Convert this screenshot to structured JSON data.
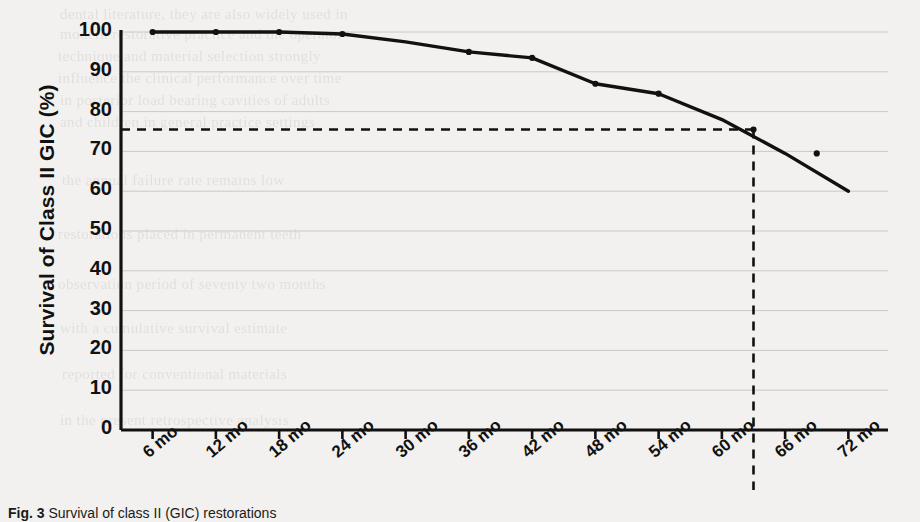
{
  "figure": {
    "caption_label": "Fig. 3",
    "caption_text": "Survival of class II (GIC) restorations"
  },
  "axes": {
    "y_title": "Survival of Class II GIC (%)",
    "y_ticks": [
      "100",
      "90",
      "80",
      "70",
      "60",
      "50",
      "40",
      "30",
      "20",
      "10",
      "0"
    ],
    "x_ticks": [
      "6 mo",
      "12 mo",
      "18 mo",
      "24 mo",
      "30 mo",
      "36 mo",
      "42 mo",
      "48 mo",
      "54 mo",
      "60 mo",
      "66 mo",
      "72 mo"
    ]
  },
  "colors": {
    "line": "#111111",
    "gridline": "#c9c9c9",
    "axis": "#111111",
    "reference": "#111111",
    "background": "#f2f1ef"
  },
  "bleed_through_text": [
    {
      "text": "dental literature, they are also widely used in",
      "x": 60,
      "y": 6
    },
    {
      "text": "modern restorative practice and the operator",
      "x": 60,
      "y": 26
    },
    {
      "text": "technique and material selection strongly",
      "x": 58,
      "y": 48
    },
    {
      "text": "influence the clinical performance over time",
      "x": 58,
      "y": 70
    },
    {
      "text": "in posterior load bearing cavities of adults",
      "x": 60,
      "y": 92
    },
    {
      "text": "and children in general practice settings",
      "x": 60,
      "y": 114
    },
    {
      "text": "the annual failure rate remains low",
      "x": 62,
      "y": 172
    },
    {
      "text": "restorations placed in permanent teeth",
      "x": 58,
      "y": 226
    },
    {
      "text": "observation period of seventy two months",
      "x": 58,
      "y": 276
    },
    {
      "text": "with a cumulative survival estimate",
      "x": 60,
      "y": 320
    },
    {
      "text": "reported for conventional materials",
      "x": 62,
      "y": 366
    },
    {
      "text": "in the present retrospective analysis",
      "x": 60,
      "y": 412
    }
  ],
  "chart_data": {
    "type": "line",
    "title": "",
    "xlabel": "",
    "ylabel": "Survival of Class II GIC (%)",
    "x": [
      "6 mo",
      "12 mo",
      "18 mo",
      "24 mo",
      "30 mo",
      "36 mo",
      "42 mo",
      "48 mo",
      "54 mo",
      "60 mo",
      "66 mo",
      "72 mo"
    ],
    "x_months": [
      6,
      12,
      18,
      24,
      30,
      36,
      42,
      48,
      54,
      60,
      66,
      72
    ],
    "series": [
      {
        "name": "Survival of Class II GIC",
        "values": [
          100,
          100,
          100,
          99.5,
          97.5,
          95,
          93.5,
          87,
          84.5,
          78,
          69.5,
          60
        ]
      }
    ],
    "markers": [
      {
        "x_month": 6,
        "y": 100
      },
      {
        "x_month": 12,
        "y": 100
      },
      {
        "x_month": 18,
        "y": 100
      },
      {
        "x_month": 24,
        "y": 99.5
      },
      {
        "x_month": 36,
        "y": 95
      },
      {
        "x_month": 42,
        "y": 93.5
      },
      {
        "x_month": 48,
        "y": 87
      },
      {
        "x_month": 54,
        "y": 84.5
      },
      {
        "x_month": 63,
        "y": 75.5
      },
      {
        "x_month": 69,
        "y": 69.5
      }
    ],
    "ylim": [
      0,
      100
    ],
    "y_tick_step": 10,
    "xlim_months": [
      3,
      75
    ],
    "grid": "horizontal",
    "legend": "none",
    "annotations": [
      {
        "type": "reference-lines",
        "label": "median survival reference",
        "y_value": 75.5,
        "x_value_months": 63,
        "style": "dashed"
      }
    ]
  }
}
